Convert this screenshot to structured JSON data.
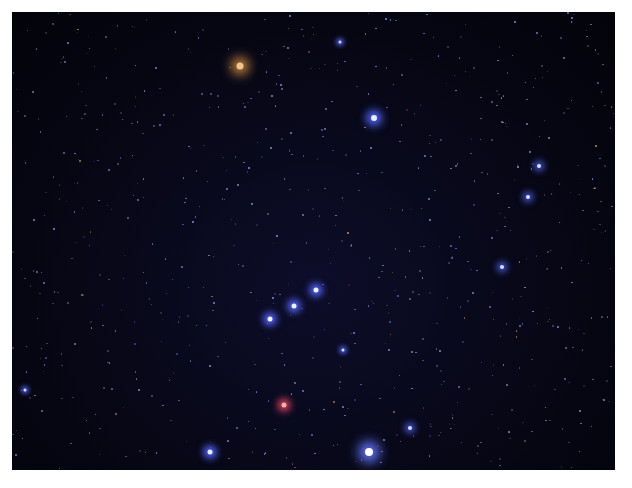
{
  "image": {
    "subject": "starfield-orion-constellation",
    "background_color": "#05050f",
    "bright_stars": [
      {
        "name": "orange-star-top-left",
        "x": 240,
        "y": 66,
        "size": 7,
        "color": "#f2c48a",
        "glow": "#c08040"
      },
      {
        "name": "blue-star-upper-right",
        "x": 374,
        "y": 118,
        "size": 6,
        "color": "#e6ecff",
        "glow": "#5566ff"
      },
      {
        "name": "star-cluster-top",
        "x": 340,
        "y": 42,
        "size": 3,
        "color": "#cfd6ff",
        "glow": "#4455cc"
      },
      {
        "name": "belt-star-left",
        "x": 270,
        "y": 319,
        "size": 5,
        "color": "#eef2ff",
        "glow": "#5566ff"
      },
      {
        "name": "belt-star-mid",
        "x": 294,
        "y": 306,
        "size": 5,
        "color": "#eef2ff",
        "glow": "#5566ff"
      },
      {
        "name": "belt-star-right",
        "x": 316,
        "y": 290,
        "size": 5,
        "color": "#eef2ff",
        "glow": "#5566ff"
      },
      {
        "name": "red-nebula-star",
        "x": 284,
        "y": 405,
        "size": 5,
        "color": "#ffb0a0",
        "glow": "#d04060"
      },
      {
        "name": "bright-star-bottom-right",
        "x": 369,
        "y": 495,
        "size": 8,
        "color": "#ffffff",
        "glow": "#6677ff"
      },
      {
        "name": "star-bottom-left",
        "x": 210,
        "y": 494,
        "size": 5,
        "color": "#e6ecff",
        "glow": "#5566ff"
      },
      {
        "name": "star-right-1",
        "x": 539,
        "y": 166,
        "size": 4,
        "color": "#d8e0ff",
        "glow": "#4455cc"
      },
      {
        "name": "star-right-2",
        "x": 528,
        "y": 197,
        "size": 4,
        "color": "#d8e0ff",
        "glow": "#4455cc"
      },
      {
        "name": "star-right-3",
        "x": 502,
        "y": 267,
        "size": 4,
        "color": "#d8e0ff",
        "glow": "#4455cc"
      },
      {
        "name": "star-mid-right",
        "x": 410,
        "y": 428,
        "size": 4,
        "color": "#d8e0ff",
        "glow": "#4455cc"
      },
      {
        "name": "star-center-lower",
        "x": 343,
        "y": 350,
        "size": 3,
        "color": "#d8e0ff",
        "glow": "#4455cc"
      },
      {
        "name": "star-far-left",
        "x": 25,
        "y": 390,
        "size": 3,
        "color": "#d8e0ff",
        "glow": "#4455cc"
      }
    ]
  }
}
